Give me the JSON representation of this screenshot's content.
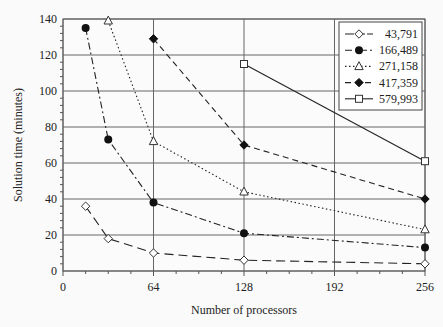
{
  "chart_data": {
    "type": "line",
    "title": "",
    "xlabel": "Number of processors",
    "ylabel": "Solution time (minutes)",
    "xlim": [
      0,
      256
    ],
    "ylim": [
      0,
      140
    ],
    "xticks": [
      0,
      64,
      128,
      192,
      256
    ],
    "yticks": [
      0,
      20,
      40,
      60,
      80,
      100,
      120,
      140
    ],
    "grid": true,
    "legend_position": "upper right",
    "series": [
      {
        "name": "43,791",
        "marker": "diamond-open",
        "line": "long-dash",
        "x": [
          16,
          32,
          64,
          128,
          256
        ],
        "values": [
          36,
          18,
          10,
          6,
          4
        ]
      },
      {
        "name": "166,489",
        "marker": "circle-filled",
        "line": "dash-dot",
        "x": [
          16,
          32,
          64,
          128,
          256
        ],
        "values": [
          135,
          73,
          38,
          21,
          13
        ]
      },
      {
        "name": "271,158",
        "marker": "triangle-open",
        "line": "dotted",
        "x": [
          32,
          64,
          128,
          256
        ],
        "values": [
          139,
          72,
          44,
          23
        ]
      },
      {
        "name": "417,359",
        "marker": "diamond-filled",
        "line": "dashed",
        "x": [
          64,
          128,
          256
        ],
        "values": [
          129,
          70,
          40
        ]
      },
      {
        "name": "579,993",
        "marker": "square-open",
        "line": "solid",
        "x": [
          128,
          256
        ],
        "values": [
          115,
          61
        ]
      }
    ]
  }
}
